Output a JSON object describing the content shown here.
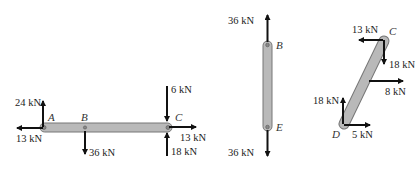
{
  "diagram": {
    "type": "free-body diagrams of members",
    "colors": {
      "member_fill": "#b9b9b9",
      "member_stroke": "#777777",
      "arrow": "#111111"
    },
    "members": [
      {
        "name": "ABC",
        "orientation": "horizontal",
        "points": {
          "A": "A",
          "B": "B",
          "C": "C"
        },
        "forces": [
          {
            "at": "A",
            "label": "24 kN",
            "direction": "up"
          },
          {
            "at": "A",
            "label": "13 kN",
            "direction": "left"
          },
          {
            "at": "B",
            "label": "36 kN",
            "direction": "down"
          },
          {
            "at": "C",
            "label": "6 kN",
            "direction": "down"
          },
          {
            "at": "C",
            "label": "13 kN",
            "direction": "right"
          },
          {
            "at": "C",
            "label": "18 kN",
            "direction": "up"
          }
        ]
      },
      {
        "name": "BE",
        "orientation": "vertical",
        "points": {
          "B": "B",
          "E": "E"
        },
        "forces": [
          {
            "at": "B",
            "label": "36 kN",
            "direction": "up"
          },
          {
            "at": "E",
            "label": "36 kN",
            "direction": "down"
          }
        ]
      },
      {
        "name": "CD",
        "orientation": "inclined",
        "points": {
          "C": "C",
          "D": "D"
        },
        "forces": [
          {
            "at": "C",
            "label": "13 kN",
            "direction": "left"
          },
          {
            "at": "C",
            "label": "18 kN",
            "direction": "down"
          },
          {
            "at": "middle",
            "label": "8 kN",
            "direction": "right"
          },
          {
            "at": "D",
            "label": "18 kN",
            "direction": "up"
          },
          {
            "at": "D",
            "label": "5 kN",
            "direction": "right"
          }
        ]
      }
    ]
  }
}
